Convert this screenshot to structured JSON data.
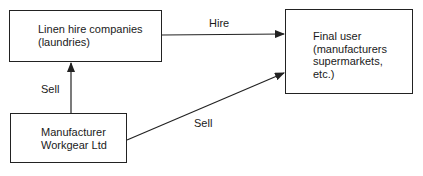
{
  "diagram": {
    "nodes": [
      {
        "id": "linen",
        "text": "Linen hire companies\n(laundries)"
      },
      {
        "id": "final",
        "text": "Final user\n(manufacturers\nsupermarkets,\netc.)"
      },
      {
        "id": "mfr",
        "text": "Manufacturer\nWorkgear Ltd"
      }
    ],
    "edges": [
      {
        "from": "linen",
        "to": "final",
        "label": "Hire"
      },
      {
        "from": "mfr",
        "to": "linen",
        "label": "Sell"
      },
      {
        "from": "mfr",
        "to": "final",
        "label": "Sell"
      }
    ],
    "line_color": "#222222"
  }
}
